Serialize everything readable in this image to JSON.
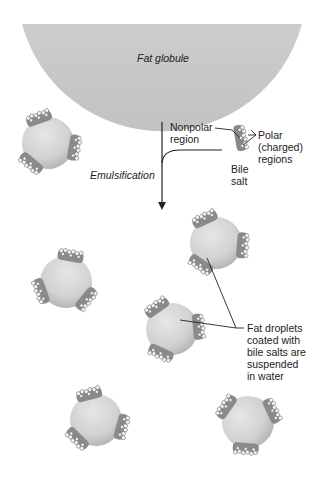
{
  "labels": {
    "fat_globule": "Fat globule",
    "emulsification": "Emulsification",
    "nonpolar_1": "Nonpolar",
    "nonpolar_2": "region",
    "polar_1": "Polar",
    "polar_2": "(charged)",
    "polar_3": "regions",
    "bile_1": "Bile",
    "bile_2": "salt",
    "droplets_1": "Fat droplets",
    "droplets_2": "coated with",
    "droplets_3": "bile salts are",
    "droplets_4": "suspended",
    "droplets_5": "in water"
  },
  "colors": {
    "globule": "#c9c9c9",
    "droplet": "#d6d6d6",
    "bile_salt": "#8a8a8a",
    "line": "#222222"
  }
}
